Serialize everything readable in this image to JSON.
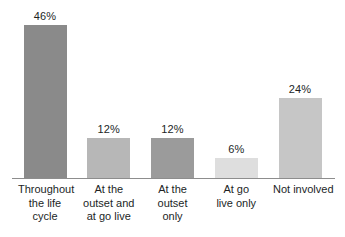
{
  "chart_data": {
    "type": "bar",
    "title": "",
    "subtitle": "",
    "xlabel": "",
    "ylabel": "",
    "ylim": [
      0,
      50
    ],
    "grid": false,
    "legend": "none",
    "categories": [
      "Throughout the life cycle",
      "At the outset and at go live",
      "At the outset only",
      "At go live only",
      "Not involved"
    ],
    "values": [
      46,
      12,
      12,
      6,
      24
    ],
    "value_labels": [
      "46%",
      "12%",
      "12%",
      "6%",
      "24%"
    ],
    "bars": [
      {
        "label_lines": [
          "Throughout",
          "the life",
          "cycle"
        ],
        "value": 46,
        "value_label": "46%",
        "color": "#8a8a8a"
      },
      {
        "label_lines": [
          "At the",
          "outset and",
          "at go live"
        ],
        "value": 12,
        "value_label": "12%",
        "color": "#b7b7b7"
      },
      {
        "label_lines": [
          "At the",
          "outset",
          "only"
        ],
        "value": 12,
        "value_label": "12%",
        "color": "#9b9b9b"
      },
      {
        "label_lines": [
          "At go",
          "live only"
        ],
        "value": 6,
        "value_label": "6%",
        "color": "#dedede"
      },
      {
        "label_lines": [
          "Not involved"
        ],
        "value": 24,
        "value_label": "24%",
        "color": "#c6c6c6"
      }
    ],
    "axis_color": "#8d8d8d",
    "text_color": "#221f1f",
    "background_color": "#ffffff"
  }
}
